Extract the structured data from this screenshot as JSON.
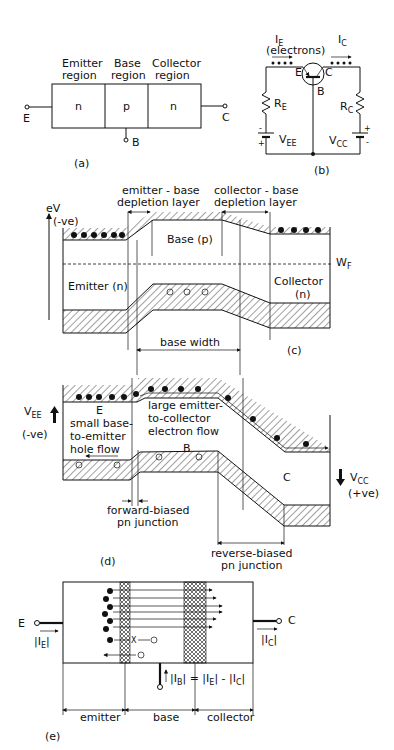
{
  "figure_a": {
    "caption": "(a)",
    "regions": [
      {
        "title_line1": "Emitter",
        "title_line2": "region",
        "type": "n"
      },
      {
        "title_line1": "Base",
        "title_line2": "region",
        "type": "p"
      },
      {
        "title_line1": "Collector",
        "title_line2": "region",
        "type": "n"
      }
    ],
    "terminals": {
      "emitter": "E",
      "base": "B",
      "collector": "C"
    }
  },
  "figure_b": {
    "caption": "(b)",
    "emitter_current": "I",
    "emitter_current_sub": "E",
    "electrons_label": "(electrons)",
    "collector_current": "I",
    "collector_current_sub": "C",
    "transistor_labels": {
      "emitter": "E",
      "collector": "C",
      "base": "B"
    },
    "resistor_emitter": "R",
    "resistor_emitter_sub": "E",
    "resistor_collector": "R",
    "resistor_collector_sub": "C",
    "supply_emitter": "V",
    "supply_emitter_sub": "EE",
    "supply_collector": "V",
    "supply_collector_sub": "CC",
    "polarity_minus": "-",
    "polarity_plus": "+"
  },
  "figure_c": {
    "caption": "(c)",
    "axis_label": "eV",
    "axis_sign": "(-ve)",
    "eb_depletion_line1": "emitter - base",
    "eb_depletion_line2": "depletion layer",
    "cb_depletion_line1": "collector - base",
    "cb_depletion_line2": "depletion layer",
    "base_label": "Base (p)",
    "emitter_label": "Emitter (n)",
    "collector_label_line1": "Collector",
    "collector_label_line2": "(n)",
    "fermi_label": "W",
    "fermi_sub": "F",
    "base_width_label": "base width",
    "hole_symbol": "+"
  },
  "figure_d": {
    "caption": "(d)",
    "vee": "V",
    "vee_sub": "EE",
    "vee_sign": "(-ve)",
    "vcc": "V",
    "vcc_sub": "CC",
    "vcc_sign": "(+ve)",
    "emitter_label": "E",
    "base_label": "B",
    "collector_label": "C",
    "hole_flow_line1": "small base-",
    "hole_flow_line2": "to-emitter",
    "hole_flow_line3": "hole flow",
    "electron_flow_line1": "large emitter-",
    "electron_flow_line2": "to-collector",
    "electron_flow_line3": "electron flow",
    "forward_line1": "forward-biased",
    "forward_line2": "pn junction",
    "reverse_line1": "reverse-biased",
    "reverse_line2": "pn junction"
  },
  "figure_e": {
    "caption": "(e)",
    "emitter_terminal": "E",
    "collector_terminal": "C",
    "ie_label": "|I",
    "ie_sub": "E",
    "ic_label": "|I",
    "ic_sub": "C",
    "base_eq_1": "|I",
    "base_eq_1_sub": "B",
    "base_eq_2": "| = |I",
    "base_eq_2_sub": "E",
    "base_eq_3": "| - |I",
    "base_eq_3_sub": "C",
    "base_eq_4": "|",
    "recomb_label": "X",
    "regions": [
      "emitter",
      "base",
      "collector"
    ]
  }
}
